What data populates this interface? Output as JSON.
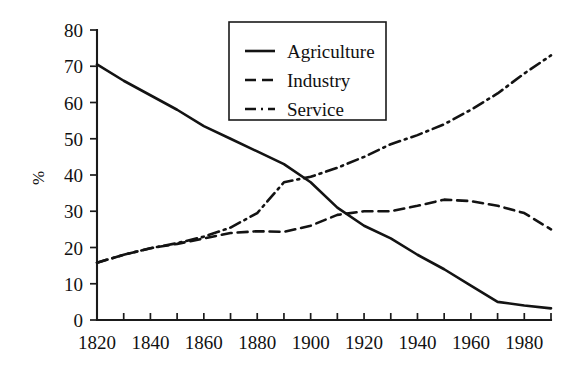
{
  "chart_data": {
    "type": "line",
    "title": "",
    "subtitle": "",
    "xlabel": "",
    "ylabel": "%",
    "xlim": [
      1820,
      1990
    ],
    "ylim": [
      0,
      80
    ],
    "grid": false,
    "legend_position": "top-center",
    "x_ticks_major": [
      1820,
      1840,
      1860,
      1880,
      1900,
      1920,
      1940,
      1960,
      1980
    ],
    "x_ticks_major_labels": [
      "1820",
      "1840",
      "1860",
      "1880",
      "1900",
      "1920",
      "1940",
      "1960",
      "1980"
    ],
    "x_ticks_minor": [
      1830,
      1850,
      1870,
      1890,
      1910,
      1930,
      1950,
      1970,
      1990
    ],
    "y_ticks": [
      0,
      10,
      20,
      30,
      40,
      50,
      60,
      70,
      80
    ],
    "y_tick_labels": [
      "0",
      "10",
      "20",
      "30",
      "40",
      "50",
      "60",
      "70",
      "80"
    ],
    "x": [
      1820,
      1830,
      1840,
      1850,
      1860,
      1870,
      1880,
      1890,
      1900,
      1910,
      1920,
      1930,
      1940,
      1950,
      1960,
      1970,
      1980,
      1990
    ],
    "series": [
      {
        "name": "Agriculture",
        "style": "solid",
        "color": "#131313",
        "values": [
          70.5,
          66.0,
          62.0,
          58.0,
          53.5,
          50.0,
          46.5,
          43.0,
          38.0,
          31.0,
          26.0,
          22.5,
          18.0,
          14.0,
          9.5,
          5.0,
          4.0,
          3.2
        ]
      },
      {
        "name": "Industry",
        "style": "dashed",
        "color": "#131313",
        "values": [
          15.8,
          18.0,
          19.8,
          21.0,
          22.5,
          24.0,
          24.5,
          24.3,
          26.0,
          29.0,
          30.0,
          30.0,
          31.5,
          33.2,
          32.8,
          31.5,
          29.5,
          25.0
        ]
      },
      {
        "name": "Service",
        "style": "dashdot",
        "color": "#131313",
        "values": [
          15.8,
          18.0,
          19.8,
          21.2,
          23.0,
          25.5,
          29.5,
          38.0,
          39.5,
          42.0,
          45.0,
          48.5,
          51.0,
          54.0,
          58.0,
          62.5,
          68.0,
          73.0
        ]
      }
    ]
  },
  "legend": {
    "entries": [
      {
        "label": "Agriculture",
        "style": "solid"
      },
      {
        "label": "Industry",
        "style": "dashed"
      },
      {
        "label": "Service",
        "style": "dashdot"
      }
    ]
  },
  "axes": {
    "y_axis_title": "%"
  }
}
